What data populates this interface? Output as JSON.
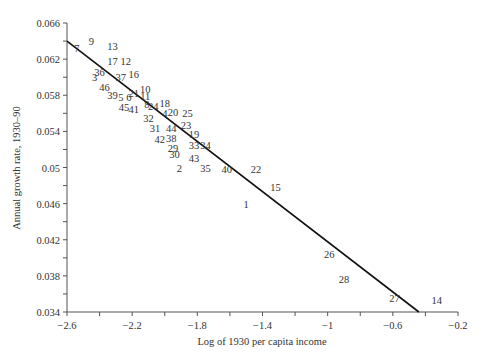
{
  "chart_data": {
    "type": "scatter",
    "title": "",
    "xlabel": "Log of 1930 per capita income",
    "ylabel": "Annual growth rate, 1930–90",
    "xlim": [
      -2.6,
      -0.2
    ],
    "ylim": [
      0.034,
      0.066
    ],
    "grid": false,
    "legend": null,
    "x_ticks": [
      -2.6,
      -2.4,
      -2.2,
      -2.0,
      -1.8,
      -1.6,
      -1.4,
      -1.2,
      -1.0,
      -0.8,
      -0.6,
      -0.4,
      -0.2
    ],
    "x_tick_labels": [
      "−2.6",
      "",
      "−2.2",
      "",
      "−1.8",
      "",
      "−1.4",
      "",
      "−1",
      "",
      "−0.6",
      "",
      "−0.2"
    ],
    "y_ticks": [
      0.034,
      0.036,
      0.038,
      0.04,
      0.042,
      0.044,
      0.046,
      0.048,
      0.05,
      0.052,
      0.054,
      0.056,
      0.058,
      0.06,
      0.062,
      0.064,
      0.066
    ],
    "y_tick_labels": [
      "0.034",
      "",
      "0.038",
      "",
      "0.042",
      "",
      "0.046",
      "",
      "0.05",
      "",
      "0.054",
      "",
      "0.058",
      "",
      "0.062",
      "",
      "0.066"
    ],
    "markers": "numeric labels (observation ids)",
    "points": [
      {
        "label": "1",
        "x": -1.5,
        "y": 0.046
      },
      {
        "label": "2",
        "x": -1.91,
        "y": 0.05
      },
      {
        "label": "3",
        "x": -2.43,
        "y": 0.06
      },
      {
        "label": "4",
        "x": -2.0,
        "y": 0.056
      },
      {
        "label": "5",
        "x": -2.27,
        "y": 0.0578
      },
      {
        "label": "6",
        "x": -2.22,
        "y": 0.0578
      },
      {
        "label": "7",
        "x": -2.54,
        "y": 0.0632
      },
      {
        "label": "8",
        "x": -2.11,
        "y": 0.057
      },
      {
        "label": "9",
        "x": -2.45,
        "y": 0.064
      },
      {
        "label": "10",
        "x": -2.12,
        "y": 0.0587
      },
      {
        "label": "11",
        "x": -2.12,
        "y": 0.0579
      },
      {
        "label": "12",
        "x": -2.24,
        "y": 0.0618
      },
      {
        "label": "13",
        "x": -2.32,
        "y": 0.0634
      },
      {
        "label": "14",
        "x": -0.33,
        "y": 0.0353
      },
      {
        "label": "15",
        "x": -1.32,
        "y": 0.0478
      },
      {
        "label": "16",
        "x": -2.19,
        "y": 0.0603
      },
      {
        "label": "17",
        "x": -2.32,
        "y": 0.0618
      },
      {
        "label": "18",
        "x": -2.0,
        "y": 0.0571
      },
      {
        "label": "19",
        "x": -1.82,
        "y": 0.0537
      },
      {
        "label": "20",
        "x": -1.95,
        "y": 0.0562
      },
      {
        "label": "21",
        "x": -2.19,
        "y": 0.0583
      },
      {
        "label": "22",
        "x": -1.44,
        "y": 0.0498
      },
      {
        "label": "23",
        "x": -1.87,
        "y": 0.0547
      },
      {
        "label": "24",
        "x": -2.07,
        "y": 0.0568
      },
      {
        "label": "25",
        "x": -1.86,
        "y": 0.056
      },
      {
        "label": "26",
        "x": -0.99,
        "y": 0.0404
      },
      {
        "label": "27",
        "x": -0.59,
        "y": 0.0355
      },
      {
        "label": "28",
        "x": -0.9,
        "y": 0.0377
      },
      {
        "label": "29",
        "x": -1.95,
        "y": 0.0522
      },
      {
        "label": "30",
        "x": -1.94,
        "y": 0.0515
      },
      {
        "label": "31",
        "x": -2.06,
        "y": 0.0544
      },
      {
        "label": "32",
        "x": -2.1,
        "y": 0.0555
      },
      {
        "label": "33",
        "x": -1.82,
        "y": 0.0525
      },
      {
        "label": "34",
        "x": -1.75,
        "y": 0.0525
      },
      {
        "label": "35",
        "x": -1.75,
        "y": 0.05
      },
      {
        "label": "36",
        "x": -2.4,
        "y": 0.0606
      },
      {
        "label": "37",
        "x": -2.27,
        "y": 0.06
      },
      {
        "label": "38",
        "x": -1.96,
        "y": 0.0533
      },
      {
        "label": "39",
        "x": -2.32,
        "y": 0.058
      },
      {
        "label": "40",
        "x": -1.62,
        "y": 0.0498
      },
      {
        "label": "41",
        "x": -2.19,
        "y": 0.0565
      },
      {
        "label": "42",
        "x": -2.03,
        "y": 0.0532
      },
      {
        "label": "43",
        "x": -1.82,
        "y": 0.0511
      },
      {
        "label": "44",
        "x": -1.96,
        "y": 0.0544
      },
      {
        "label": "45",
        "x": -2.25,
        "y": 0.0567
      },
      {
        "label": "46",
        "x": -2.37,
        "y": 0.0589
      }
    ],
    "fit_line": {
      "x": [
        -2.6,
        -0.44
      ],
      "y": [
        0.064,
        0.034
      ]
    }
  }
}
